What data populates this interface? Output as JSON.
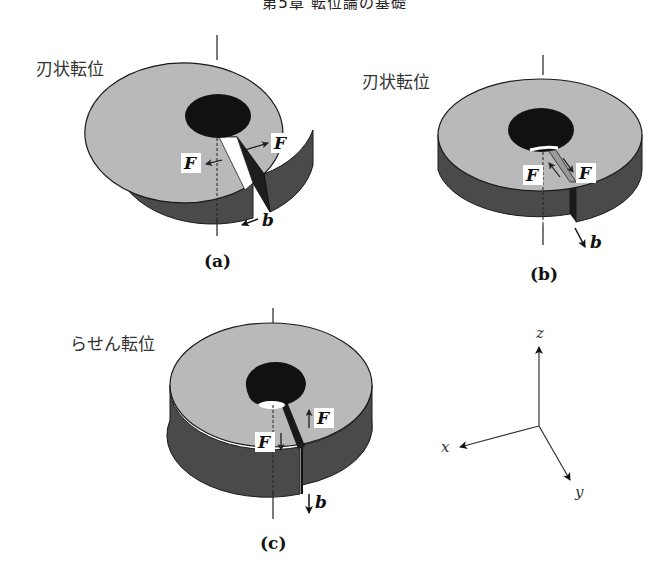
{
  "header": {
    "text": "第5章 転位論の基礎"
  },
  "figure": {
    "panels": [
      {
        "id": "a",
        "title": "刃状転位",
        "sublabel": "(a)",
        "force_labels": [
          "F",
          "F"
        ],
        "burgers_label": "b",
        "burgers_direction": "left (along -x)"
      },
      {
        "id": "b",
        "title": "刃状転位",
        "sublabel": "(b)",
        "force_labels": [
          "F",
          "F"
        ],
        "burgers_label": "b",
        "burgers_direction": "down-right (along +y)"
      },
      {
        "id": "c",
        "title": "らせん転位",
        "sublabel": "(c)",
        "force_labels": [
          "F",
          "F"
        ],
        "burgers_label": "b",
        "burgers_direction": "down (along -z)"
      }
    ],
    "axes": {
      "x": "x",
      "y": "y",
      "z": "z"
    },
    "colors": {
      "top_face": "#b9b9b9",
      "side_face": "#4a4a4a",
      "hole": "#111111",
      "outline": "#1a1a1a",
      "background": "#ffffff"
    }
  }
}
